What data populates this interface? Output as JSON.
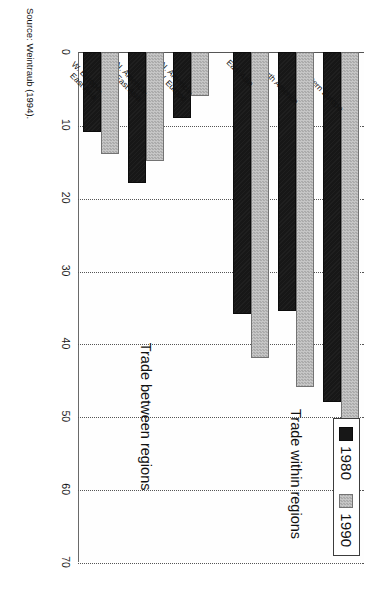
{
  "chart_data": {
    "type": "bar",
    "orientation": "horizontal",
    "title": "",
    "xlabel": "",
    "ylabel": "",
    "xlim": [
      0,
      70
    ],
    "xticks": [
      0,
      10,
      20,
      30,
      40,
      50,
      60,
      70
    ],
    "xtick_labels": [
      "0",
      "10",
      "20",
      "30",
      "40",
      "50",
      "60",
      "70"
    ],
    "grid": true,
    "grid_style": "dotted",
    "legend_position": "top-left",
    "categories": [
      "Western Europe",
      "North America",
      "East Asia",
      "N. America-|W. Europe",
      "N. America-|East Asia",
      "W. Europe-|East Asia"
    ],
    "series": [
      {
        "name": "1980",
        "color": "#171717",
        "values": [
          48,
          35.5,
          36,
          9,
          18,
          11
        ]
      },
      {
        "name": "1990",
        "color": "#b9b9b9",
        "values": [
          59.5,
          46,
          42,
          6,
          15,
          14
        ]
      }
    ],
    "groups": [
      {
        "label": "Trade within regions",
        "categories": [
          "Western Europe",
          "North America",
          "East Asia"
        ]
      },
      {
        "label": "Trade between regions",
        "categories": [
          "N. America-|W. Europe",
          "N. America-|East Asia",
          "W. Europe-|East Asia"
        ]
      }
    ],
    "annotations": [
      "Trade within regions",
      "Trade between regions"
    ]
  },
  "legend": {
    "items": [
      {
        "label": "1980",
        "swatch": "legend-swatch-1980"
      },
      {
        "label": "1990",
        "swatch": "legend-swatch-1990"
      }
    ]
  },
  "axis": {
    "ticks": [
      "0",
      "10",
      "20",
      "30",
      "40",
      "50",
      "60",
      "70"
    ]
  },
  "category_labels": [
    {
      "line1": "Western Europe",
      "line2": ""
    },
    {
      "line1": "North America",
      "line2": ""
    },
    {
      "line1": "East Asia",
      "line2": ""
    },
    {
      "line1": "N. America-",
      "line2": "W. Europe"
    },
    {
      "line1": "N. America-",
      "line2": "East Asia"
    },
    {
      "line1": "W. Europe-",
      "line2": "East Asia"
    }
  ],
  "sections": {
    "within": "Trade within regions",
    "between": "Trade between regions"
  },
  "source": "Source: Weintraub (1994)."
}
